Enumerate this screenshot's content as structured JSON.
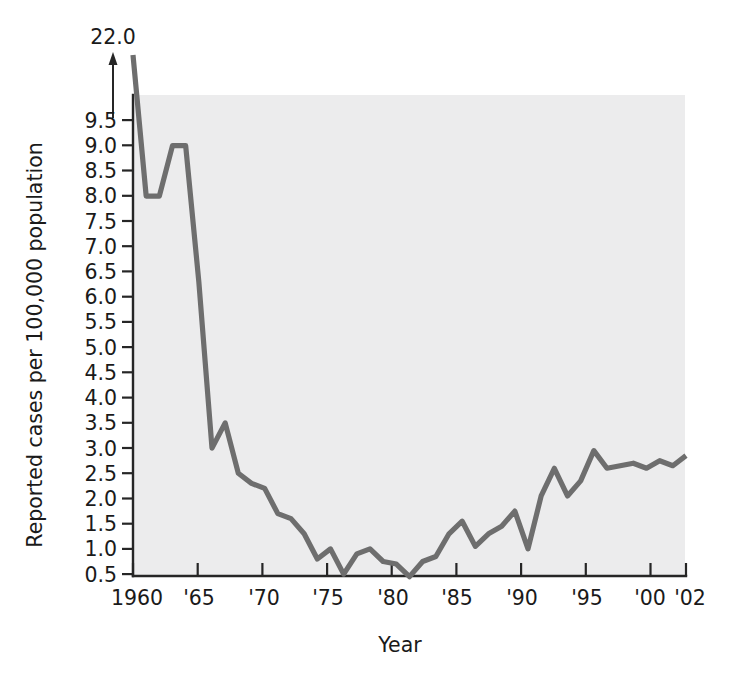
{
  "chart_data": {
    "type": "line",
    "title": "",
    "subtitle": "",
    "xlabel": "Year",
    "ylabel": "Reported cases per 100,000 population",
    "xlim": [
      1960,
      2002
    ],
    "ylim": [
      0.0,
      9.75
    ],
    "grid": false,
    "legend": null,
    "axis_break_note": "22.0",
    "axis_break_description": "Y axis is truncated; 1960 value of 22.0 is indicated by an upward arrow above the 9.5 tick.",
    "ytick_labels": [
      "9.5",
      "9.0",
      "8.5",
      "8.0",
      "7.5",
      "7.0",
      "6.5",
      "6.0",
      "5.5",
      "5.0",
      "4.5",
      "4.0",
      "3.5",
      "3.0",
      "2.5",
      "2.0",
      "1.5",
      "1.0",
      "0.5"
    ],
    "ytick_values": [
      9.5,
      9.0,
      8.5,
      8.0,
      7.5,
      7.0,
      6.5,
      6.0,
      5.5,
      5.0,
      4.5,
      4.0,
      3.5,
      3.0,
      2.5,
      2.0,
      1.5,
      1.0,
      0.5
    ],
    "xtick_labels": [
      "1960",
      "'65",
      "'70",
      "'75",
      "'80",
      "'85",
      "'90",
      "'95",
      "'00",
      "'02"
    ],
    "xtick_values": [
      1960,
      1965,
      1970,
      1975,
      1980,
      1985,
      1990,
      1995,
      2000,
      2002
    ],
    "x": [
      1960,
      1961,
      1962,
      1963,
      1964,
      1965,
      1966,
      1967,
      1968,
      1969,
      1970,
      1971,
      1972,
      1973,
      1974,
      1975,
      1976,
      1977,
      1978,
      1979,
      1980,
      1981,
      1982,
      1983,
      1984,
      1985,
      1986,
      1987,
      1988,
      1989,
      1990,
      1991,
      1992,
      1993,
      1994,
      1995,
      1996,
      1997,
      1998,
      1999,
      2000,
      2001,
      2002
    ],
    "values": [
      22.0,
      8.0,
      8.0,
      9.0,
      9.0,
      6.3,
      3.0,
      3.5,
      2.5,
      2.3,
      2.2,
      1.7,
      1.6,
      1.3,
      0.8,
      1.0,
      0.5,
      0.9,
      1.0,
      0.75,
      0.7,
      0.45,
      0.75,
      0.85,
      1.3,
      1.55,
      1.05,
      1.3,
      1.45,
      1.75,
      1.0,
      2.05,
      2.6,
      2.05,
      2.35,
      2.95,
      2.6,
      2.65,
      2.7,
      2.6,
      2.75,
      2.65,
      2.85
    ],
    "series": [
      {
        "name": "Reported cases per 100,000 population",
        "color": "#6e6e6e",
        "values": [
          22.0,
          8.0,
          8.0,
          9.0,
          9.0,
          6.3,
          3.0,
          3.5,
          2.5,
          2.3,
          2.2,
          1.7,
          1.6,
          1.3,
          0.8,
          1.0,
          0.5,
          0.9,
          1.0,
          0.75,
          0.7,
          0.45,
          0.75,
          0.85,
          1.3,
          1.55,
          1.05,
          1.3,
          1.45,
          1.75,
          1.0,
          2.05,
          2.6,
          2.05,
          2.35,
          2.95,
          2.6,
          2.65,
          2.7,
          2.6,
          2.75,
          2.65,
          2.85
        ]
      }
    ],
    "colors": {
      "line": "#6e6e6e",
      "panel_background": "#ececed",
      "axis": "#262626",
      "text": "#1a1a1a",
      "figure_background": "#ffffff"
    }
  },
  "axes": {
    "y_axis_title": "Reported cases per 100,000 population",
    "x_axis_title": "Year",
    "top_annotation": "22.0"
  }
}
